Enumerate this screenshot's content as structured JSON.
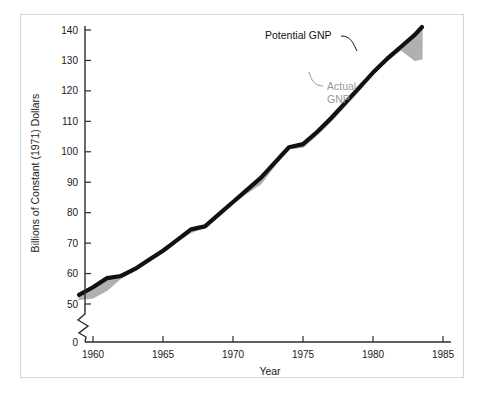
{
  "chart_data": {
    "type": "area",
    "title": "",
    "subtitle": "",
    "xlabel": "Year",
    "ylabel": "Billions of Constant (1971) Dollars",
    "xlim": [
      1959,
      1986
    ],
    "ylim": [
      50,
      145
    ],
    "y_axis_break": true,
    "y_axis_break_note": "axis broken between 0 and 50",
    "grid": false,
    "legend_position": "inline-annotations",
    "xticks": [
      "1960",
      "1965",
      "1970",
      "1975",
      "1980",
      "1985"
    ],
    "xtick_values": [
      1960,
      1965,
      1970,
      1975,
      1980,
      1985
    ],
    "yticks": [
      "0",
      "50",
      "60",
      "70",
      "80",
      "90",
      "100",
      "110",
      "120",
      "130",
      "140"
    ],
    "ytick_values": [
      0,
      50,
      60,
      70,
      80,
      90,
      100,
      110,
      120,
      130,
      140
    ],
    "x": [
      1959,
      1960,
      1961,
      1962,
      1963,
      1964,
      1965,
      1966,
      1967,
      1968,
      1969,
      1970,
      1971,
      1972,
      1973,
      1974,
      1975,
      1976,
      1977,
      1978,
      1979,
      1980,
      1981,
      1982,
      1983,
      1983.5
    ],
    "series": [
      {
        "name": "Potential GNP",
        "color": "#111111",
        "values": [
          53.0,
          55.5,
          58.5,
          59.2,
          61.5,
          64.5,
          67.5,
          71.0,
          74.5,
          75.5,
          79.5,
          83.5,
          87.5,
          91.5,
          96.5,
          101.5,
          102.5,
          106.5,
          111.0,
          116.0,
          121.0,
          126.0,
          130.5,
          134.5,
          138.5,
          141.0
        ]
      },
      {
        "name": "Actual GNP",
        "color": "#b0b0b0",
        "values": [
          51.5,
          52.0,
          54.5,
          58.5,
          61.0,
          64.0,
          67.0,
          70.5,
          73.5,
          75.2,
          79.0,
          83.0,
          86.5,
          89.5,
          95.5,
          101.0,
          101.5,
          105.5,
          110.0,
          115.0,
          120.0,
          125.5,
          130.0,
          133.5,
          130.0,
          130.5
        ]
      }
    ],
    "annotations": [
      {
        "text": "Potential GNP",
        "series": "Potential GNP",
        "color": "#111111"
      },
      {
        "text": "Actual\nGNP",
        "series": "Actual GNP",
        "color": "#9a9a9a",
        "line1": "Actual",
        "line2": "GNP"
      }
    ]
  },
  "figure": {
    "background": "#ffffff",
    "frame_color": "#d7d7d7",
    "axis_color": "#2b2b2b"
  }
}
